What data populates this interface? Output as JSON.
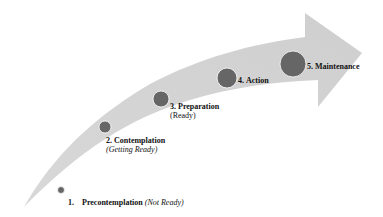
{
  "diagram": {
    "type": "curved-arrow-stages",
    "arrow_color": "#d4d4d4",
    "circle_color": "#666666",
    "stages": [
      {
        "number": "1.",
        "title": "Precontemplation",
        "subtitle": "(Not Ready)"
      },
      {
        "number": "2.",
        "title": "Contemplation",
        "subtitle": "(Getting Ready)"
      },
      {
        "number": "3.",
        "title": "Preparation",
        "subtitle": "(Ready)"
      },
      {
        "number": "4.",
        "title": "Action",
        "subtitle": ""
      },
      {
        "number": "5.",
        "title": "Maintenance",
        "subtitle": ""
      }
    ]
  }
}
